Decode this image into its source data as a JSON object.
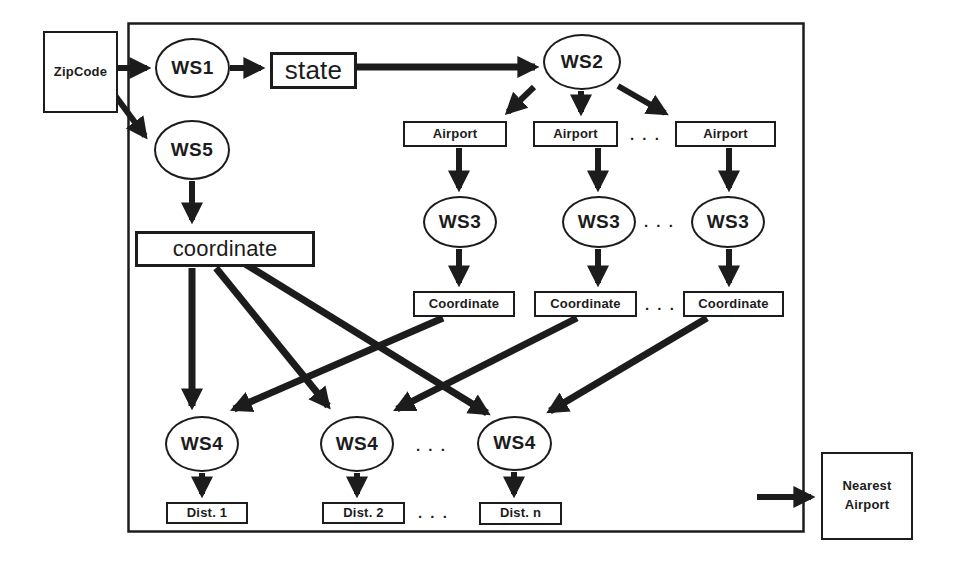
{
  "figure": {
    "type": "workflow-diagram",
    "background": "#ffffff",
    "ink_color": "#1c1c1c"
  },
  "nodes": {
    "zipcode": "ZipCode",
    "ws1": "WS1",
    "state": "state",
    "ws2": "WS2",
    "ws5": "WS5",
    "coordinate_input": "coordinate",
    "airport_1": "Airport",
    "airport_2": "Airport",
    "airport_n": "Airport",
    "ws3_1": "WS3",
    "ws3_2": "WS3",
    "ws3_n": "WS3",
    "coordinate_1": "Coordinate",
    "coordinate_2": "Coordinate",
    "coordinate_n": "Coordinate",
    "ws4_1": "WS4",
    "ws4_2": "WS4",
    "ws4_n": "WS4",
    "dist_1": "Dist. 1",
    "dist_2": "Dist. 2",
    "dist_n": "Dist. n",
    "nearest_airport": {
      "line1": "Nearest",
      "line2": "Airport"
    }
  },
  "ellipsis": ". . .",
  "edges": [
    {
      "from": "ZipCode",
      "to": "WS1"
    },
    {
      "from": "WS1",
      "to": "state"
    },
    {
      "from": "state",
      "to": "WS2"
    },
    {
      "from": "ZipCode",
      "to": "WS5"
    },
    {
      "from": "WS5",
      "to": "coordinate"
    },
    {
      "from": "WS2",
      "to": "Airport (1)"
    },
    {
      "from": "WS2",
      "to": "Airport (2)"
    },
    {
      "from": "WS2",
      "to": "Airport (n)"
    },
    {
      "from": "Airport (1)",
      "to": "WS3 (1)"
    },
    {
      "from": "Airport (2)",
      "to": "WS3 (2)"
    },
    {
      "from": "Airport (n)",
      "to": "WS3 (n)"
    },
    {
      "from": "WS3 (1)",
      "to": "Coordinate (1)"
    },
    {
      "from": "WS3 (2)",
      "to": "Coordinate (2)"
    },
    {
      "from": "WS3 (n)",
      "to": "Coordinate (n)"
    },
    {
      "from": "coordinate",
      "to": "WS4 (1)"
    },
    {
      "from": "coordinate",
      "to": "WS4 (2)"
    },
    {
      "from": "coordinate",
      "to": "WS4 (n)"
    },
    {
      "from": "Coordinate (1)",
      "to": "WS4 (1)"
    },
    {
      "from": "Coordinate (2)",
      "to": "WS4 (2)"
    },
    {
      "from": "Coordinate (n)",
      "to": "WS4 (n)"
    },
    {
      "from": "WS4 (1)",
      "to": "Dist. 1"
    },
    {
      "from": "WS4 (2)",
      "to": "Dist. 2"
    },
    {
      "from": "WS4 (n)",
      "to": "Dist. n"
    },
    {
      "from": "system boundary",
      "to": "Nearest Airport"
    }
  ]
}
